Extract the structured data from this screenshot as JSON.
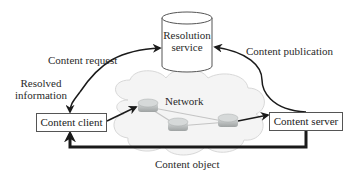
{
  "diagram": {
    "nodes": {
      "resolution_service": {
        "label_line1": "Resolution",
        "label_line2": "service",
        "shape": "cylinder-icon"
      },
      "content_client": {
        "label": "Content client",
        "shape": "box"
      },
      "content_server": {
        "label": "Content server",
        "shape": "box"
      },
      "network": {
        "label": "Network",
        "shape": "cloud-icon",
        "routers": 3
      }
    },
    "edges": {
      "content_request": {
        "label": "Content request",
        "from": "Content client",
        "to": "Resolution service"
      },
      "resolved_information": {
        "label_line1": "Resolved",
        "label_line2": "information",
        "from": "Resolution service",
        "to": "Content client"
      },
      "content_publication": {
        "label": "Content publication",
        "from": "Content server",
        "to": "Resolution service"
      },
      "content_object": {
        "label": "Content object",
        "from": "Content server",
        "to": "Content client"
      }
    },
    "colors": {
      "line": "#1a1a1a",
      "cloud_fill": "#f4f4f4",
      "cloud_stroke": "#d8d8d8",
      "router": "#b9bcbc",
      "box_border": "#555555"
    }
  }
}
